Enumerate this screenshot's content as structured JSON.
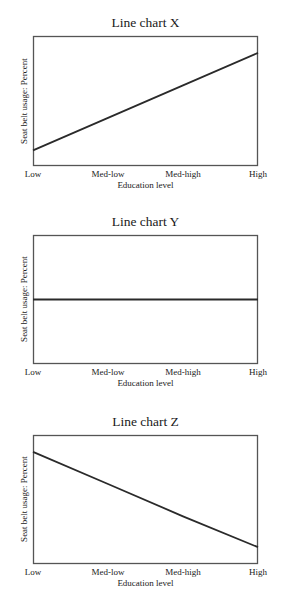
{
  "chart_data": [
    {
      "type": "line",
      "title": "Line chart X",
      "xlabel": "Education level",
      "ylabel": "Seat belt usage: Percent",
      "categories": [
        "Low",
        "Med-low",
        "Med-high",
        "High"
      ],
      "values": [
        12,
        37,
        62,
        87
      ],
      "ylim": [
        0,
        100
      ],
      "grid": false,
      "legend": null,
      "line_color": "#2a2a2a"
    },
    {
      "type": "line",
      "title": "Line chart Y",
      "xlabel": "Education level",
      "ylabel": "Seat belt usage: Percent",
      "categories": [
        "Low",
        "Med-low",
        "Med-high",
        "High"
      ],
      "values": [
        50,
        50,
        50,
        50
      ],
      "ylim": [
        0,
        100
      ],
      "grid": false,
      "legend": null,
      "line_color": "#2a2a2a"
    },
    {
      "type": "line",
      "title": "Line chart Z",
      "xlabel": "Education level",
      "ylabel": "Seat belt usage: Percent",
      "categories": [
        "Low",
        "Med-low",
        "Med-high",
        "High"
      ],
      "values": [
        87,
        62,
        37,
        13
      ],
      "ylim": [
        0,
        100
      ],
      "grid": false,
      "legend": null,
      "line_color": "#2a2a2a"
    }
  ],
  "colors": {
    "axis": "#555555",
    "line": "#2a2a2a",
    "background": "#ffffff"
  }
}
